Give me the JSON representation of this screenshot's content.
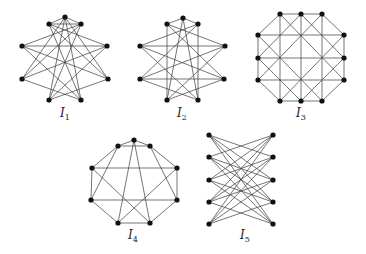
{
  "figure": {
    "graphs": [
      {
        "id": "I1",
        "label": "I",
        "subscript": "1",
        "label_pos": [
          60,
          117
        ],
        "vertices": {
          "A": [
            65,
            17
          ],
          "B": [
            49,
            24
          ],
          "C": [
            81,
            24
          ],
          "D": [
            22,
            46
          ],
          "E": [
            107,
            46
          ],
          "F": [
            22,
            79
          ],
          "G": [
            108,
            79
          ],
          "H": [
            49,
            100
          ],
          "I": [
            81,
            100
          ]
        },
        "edges": [
          [
            "A",
            "B"
          ],
          [
            "A",
            "C"
          ],
          [
            "B",
            "C"
          ],
          [
            "A",
            "H"
          ],
          [
            "A",
            "I"
          ],
          [
            "B",
            "E"
          ],
          [
            "B",
            "G"
          ],
          [
            "B",
            "I"
          ],
          [
            "C",
            "D"
          ],
          [
            "C",
            "F"
          ],
          [
            "C",
            "H"
          ],
          [
            "D",
            "E"
          ],
          [
            "D",
            "G"
          ],
          [
            "D",
            "I"
          ],
          [
            "E",
            "F"
          ],
          [
            "E",
            "H"
          ],
          [
            "F",
            "I"
          ],
          [
            "G",
            "H"
          ],
          [
            "G",
            "A"
          ],
          [
            "F",
            "A"
          ]
        ]
      },
      {
        "id": "I2",
        "label": "I",
        "subscript": "2",
        "label_pos": [
          177,
          117
        ],
        "vertices": {
          "A": [
            183,
            18
          ],
          "B": [
            167,
            24
          ],
          "C": [
            198,
            24
          ],
          "D": [
            140,
            46
          ],
          "E": [
            225,
            46
          ],
          "F": [
            140,
            79
          ],
          "G": [
            224,
            79
          ],
          "H": [
            167,
            100
          ],
          "I": [
            198,
            100
          ]
        },
        "edges": [
          [
            "A",
            "B"
          ],
          [
            "A",
            "C"
          ],
          [
            "A",
            "H"
          ],
          [
            "A",
            "I"
          ],
          [
            "B",
            "H"
          ],
          [
            "C",
            "I"
          ],
          [
            "B",
            "E"
          ],
          [
            "B",
            "G"
          ],
          [
            "C",
            "D"
          ],
          [
            "C",
            "F"
          ],
          [
            "D",
            "E"
          ],
          [
            "F",
            "G"
          ],
          [
            "D",
            "G"
          ],
          [
            "D",
            "I"
          ],
          [
            "E",
            "F"
          ],
          [
            "E",
            "H"
          ],
          [
            "F",
            "I"
          ],
          [
            "G",
            "H"
          ]
        ]
      },
      {
        "id": "I3",
        "label": "I",
        "subscript": "3",
        "label_pos": [
          296,
          117
        ],
        "vertices": {
          "T1": [
            280,
            14
          ],
          "T2": [
            301,
            14
          ],
          "T3": [
            322,
            14
          ],
          "L1": [
            258,
            35
          ],
          "L2": [
            258,
            58
          ],
          "L3": [
            258,
            80
          ],
          "R1": [
            344,
            35
          ],
          "R2": [
            344,
            58
          ],
          "R3": [
            344,
            80
          ],
          "B1": [
            280,
            101
          ],
          "B2": [
            301,
            101
          ],
          "B3": [
            322,
            101
          ]
        },
        "edges": [
          [
            "T1",
            "T2"
          ],
          [
            "T2",
            "T3"
          ],
          [
            "T3",
            "R1"
          ],
          [
            "R1",
            "R2"
          ],
          [
            "R2",
            "R3"
          ],
          [
            "R3",
            "B3"
          ],
          [
            "B3",
            "B2"
          ],
          [
            "B2",
            "B1"
          ],
          [
            "B1",
            "L3"
          ],
          [
            "L3",
            "L2"
          ],
          [
            "L2",
            "L1"
          ],
          [
            "L1",
            "T1"
          ],
          [
            "T1",
            "B1"
          ],
          [
            "T2",
            "B2"
          ],
          [
            "T3",
            "B3"
          ],
          [
            "L1",
            "R1"
          ],
          [
            "L2",
            "R2"
          ],
          [
            "L3",
            "R3"
          ],
          [
            "T1",
            "R3"
          ],
          [
            "L1",
            "B3"
          ],
          [
            "T3",
            "L3"
          ],
          [
            "R1",
            "B1"
          ],
          [
            "T2",
            "L2"
          ],
          [
            "T2",
            "R2"
          ],
          [
            "L2",
            "B2"
          ],
          [
            "R2",
            "B2"
          ]
        ]
      },
      {
        "id": "I4",
        "label": "I",
        "subscript": "4",
        "label_pos": [
          128,
          239
        ],
        "vertices": {
          "A": [
            134,
            140
          ],
          "B": [
            118,
            146
          ],
          "C": [
            150,
            146
          ],
          "D": [
            92,
            168
          ],
          "E": [
            177,
            168
          ],
          "F": [
            91,
            200
          ],
          "G": [
            177,
            200
          ],
          "H": [
            118,
            223
          ],
          "I": [
            150,
            223
          ]
        },
        "edges": [
          [
            "A",
            "B"
          ],
          [
            "A",
            "C"
          ],
          [
            "B",
            "C"
          ],
          [
            "B",
            "D"
          ],
          [
            "C",
            "E"
          ],
          [
            "D",
            "F"
          ],
          [
            "E",
            "G"
          ],
          [
            "F",
            "H"
          ],
          [
            "G",
            "I"
          ],
          [
            "H",
            "I"
          ],
          [
            "D",
            "E"
          ],
          [
            "F",
            "G"
          ],
          [
            "A",
            "H"
          ],
          [
            "A",
            "I"
          ],
          [
            "B",
            "F"
          ],
          [
            "C",
            "G"
          ],
          [
            "D",
            "I"
          ],
          [
            "E",
            "H"
          ]
        ]
      },
      {
        "id": "I5",
        "label": "I",
        "subscript": "5",
        "label_pos": [
          240,
          239
        ],
        "left_x": 209,
        "right_x": 273,
        "rows_y": [
          135,
          157,
          180,
          202,
          224
        ],
        "description": "K5,5 minus perfect matching"
      }
    ]
  }
}
